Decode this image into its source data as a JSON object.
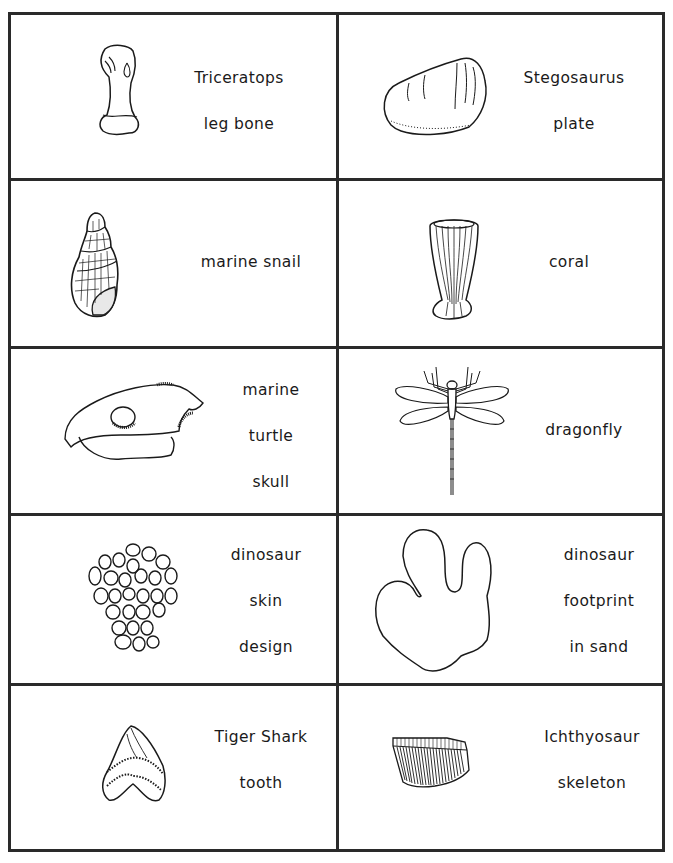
{
  "worksheet": {
    "cards": [
      {
        "id": "triceratops-leg-bone",
        "icon": "triceratops-leg-bone-icon",
        "lines": [
          "Triceratops",
          "leg bone"
        ]
      },
      {
        "id": "stegosaurus-plate",
        "icon": "stegosaurus-plate-icon",
        "lines": [
          "Stegosaurus",
          "plate"
        ]
      },
      {
        "id": "marine-snail",
        "icon": "marine-snail-icon",
        "lines": [
          "marine  snail"
        ]
      },
      {
        "id": "coral",
        "icon": "coral-icon",
        "lines": [
          "coral"
        ]
      },
      {
        "id": "marine-turtle-skull",
        "icon": "turtle-skull-icon",
        "lines": [
          "marine",
          "turtle",
          "skull"
        ]
      },
      {
        "id": "dragonfly",
        "icon": "dragonfly-icon",
        "lines": [
          "dragonfly"
        ]
      },
      {
        "id": "dinosaur-skin-design",
        "icon": "dinosaur-skin-icon",
        "lines": [
          "dinosaur",
          "skin",
          "design"
        ]
      },
      {
        "id": "dinosaur-footprint",
        "icon": "footprint-icon",
        "lines": [
          "dinosaur",
          "footprint",
          "in sand"
        ]
      },
      {
        "id": "tiger-shark-tooth",
        "icon": "shark-tooth-icon",
        "lines": [
          "Tiger Shark",
          "tooth"
        ]
      },
      {
        "id": "ichthyosaur-skeleton",
        "icon": "ichthyosaur-skeleton-icon",
        "lines": [
          "Ichthyosaur",
          "skeleton"
        ]
      }
    ],
    "colors": {
      "ink": "#1a1a1a",
      "border": "#2a2a2a",
      "paper": "#ffffff"
    }
  }
}
